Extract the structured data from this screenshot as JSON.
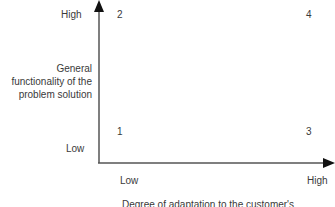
{
  "diagram": {
    "type": "2x2 matrix",
    "y_axis": {
      "label_lines": [
        "General",
        "functionality of the",
        "problem solution"
      ],
      "high": "High",
      "low": "Low"
    },
    "x_axis": {
      "label": "Degree of adaptation to the customer's",
      "low": "Low",
      "high": "High"
    },
    "quadrants": {
      "top_left": "2",
      "top_right": "4",
      "bottom_left": "1",
      "bottom_right": "3"
    },
    "colors": {
      "axis": "#3a3a3a",
      "text": "#3a3a3a",
      "background": "#ffffff"
    }
  }
}
